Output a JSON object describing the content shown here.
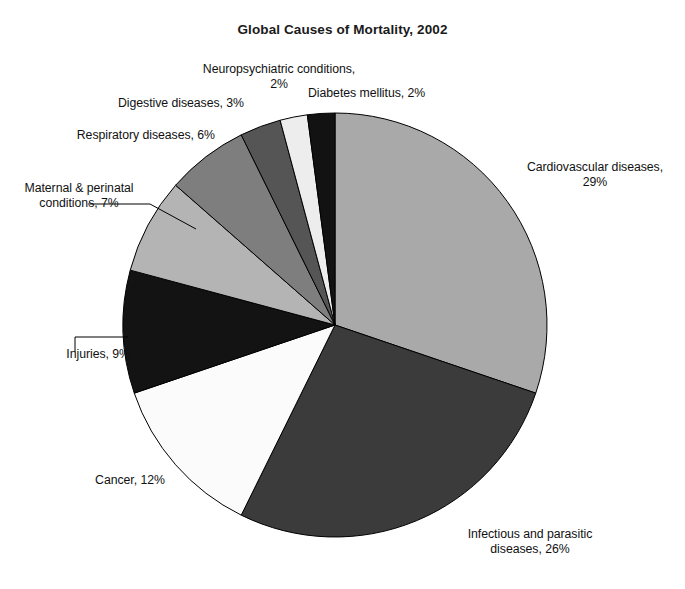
{
  "chart_data": {
    "type": "pie",
    "title": "Global Causes of Mortality, 2002",
    "xlabel": "",
    "ylabel": "",
    "legend": "none",
    "grid": false,
    "units": "percent",
    "start_angle_deg": 0,
    "direction": "clockwise",
    "categories": [
      "Cardiovascular diseases",
      "Infectious and parasitic diseases",
      "Cancer",
      "Injuries",
      "Maternal & perinatal conditions",
      "Respiratory diseases",
      "Digestive diseases",
      "Neuropsychiatric conditions",
      "Diabetes mellitus"
    ],
    "values": [
      29,
      26,
      12,
      9,
      7,
      6,
      3,
      2,
      2
    ],
    "colors": [
      "#a9a9a9",
      "#3b3b3b",
      "#fbfbfb",
      "#131313",
      "#b4b4b4",
      "#7e7e7e",
      "#555555",
      "#ededed",
      "#121212"
    ],
    "slices": [
      {
        "name": "Cardiovascular diseases",
        "value": 29,
        "label": "Cardiovascular diseases,\n29%",
        "color": "#a9a9a9"
      },
      {
        "name": "Infectious and parasitic diseases",
        "value": 26,
        "label": "Infectious and parasitic\ndiseases, 26%",
        "color": "#3b3b3b"
      },
      {
        "name": "Cancer",
        "value": 12,
        "label": "Cancer, 12%",
        "color": "#fbfbfb"
      },
      {
        "name": "Injuries",
        "value": 9,
        "label": "Injuries, 9%",
        "color": "#131313"
      },
      {
        "name": "Maternal & perinatal conditions",
        "value": 7,
        "label": "Maternal & perinatal\nconditions, 7%",
        "color": "#b4b4b4"
      },
      {
        "name": "Respiratory diseases",
        "value": 6,
        "label": "Respiratory diseases, 6%",
        "color": "#7e7e7e"
      },
      {
        "name": "Digestive diseases",
        "value": 3,
        "label": "Digestive diseases, 3%",
        "color": "#555555"
      },
      {
        "name": "Neuropsychiatric conditions",
        "value": 2,
        "label": "Neuropsychiatric conditions,\n2%",
        "color": "#ededed"
      },
      {
        "name": "Diabetes mellitus",
        "value": 2,
        "label": "Diabetes mellitus, 2%",
        "color": "#121212"
      }
    ]
  },
  "labels": {
    "cardiovascular": "Cardiovascular diseases,\n29%",
    "infectious": "Infectious and parasitic\ndiseases, 26%",
    "cancer": "Cancer, 12%",
    "injuries": "Injuries, 9%",
    "maternal": "Maternal & perinatal\nconditions, 7%",
    "respiratory": "Respiratory diseases, 6%",
    "digestive": "Digestive diseases, 3%",
    "neuropsychiatric": "Neuropsychiatric conditions,\n2%",
    "diabetes": "Diabetes mellitus, 2%"
  },
  "geometry": {
    "center_x": 335,
    "center_y": 325,
    "radius": 212
  }
}
